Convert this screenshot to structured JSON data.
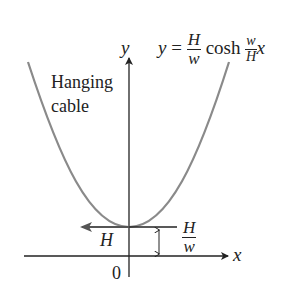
{
  "diagram": {
    "title_equation": {
      "lhs": "y",
      "eq": "=",
      "frac1_num": "H",
      "frac1_den": "w",
      "func": "cosh",
      "frac2_num": "w",
      "frac2_den": "H",
      "var": "x"
    },
    "curve_label_line1": "Hanging",
    "curve_label_line2": "cable",
    "axes": {
      "x_label": "x",
      "y_label": "y",
      "origin_label": "0"
    },
    "force_label": "H",
    "height_label": {
      "num": "H",
      "den": "w"
    },
    "colors": {
      "curve": "#8a8a8a",
      "axis": "#222222",
      "force_arrow": "#555555"
    }
  }
}
